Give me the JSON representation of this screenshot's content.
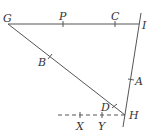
{
  "diagram": {
    "type": "geometry",
    "colors": {
      "line": "#555555",
      "text": "#333333",
      "background": "#ffffff"
    },
    "points": [
      {
        "name": "G",
        "label": "G"
      },
      {
        "name": "P",
        "label": "P"
      },
      {
        "name": "C",
        "label": "C"
      },
      {
        "name": "I",
        "label": "I"
      },
      {
        "name": "B",
        "label": "B"
      },
      {
        "name": "A",
        "label": "A"
      },
      {
        "name": "D",
        "label": "D"
      },
      {
        "name": "H",
        "label": "H"
      },
      {
        "name": "X",
        "label": "X"
      },
      {
        "name": "Y",
        "label": "Y"
      }
    ],
    "segments": [
      {
        "from": "G",
        "to": "I",
        "style": "solid"
      },
      {
        "from": "G",
        "to": "H",
        "style": "solid"
      },
      {
        "from": "I",
        "to": "H",
        "style": "solid",
        "extended": true
      },
      {
        "from": "X",
        "to": "H",
        "style": "dashed",
        "extended": true
      }
    ],
    "angle_marks": [
      {
        "at": "H",
        "label": "D"
      }
    ]
  }
}
